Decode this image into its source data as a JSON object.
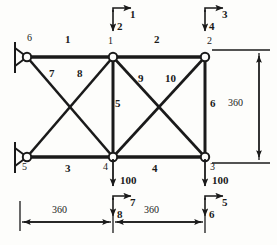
{
  "figure": {
    "type": "truss-diagram",
    "load_value": "100",
    "dimension_value": "360"
  },
  "nodes": [
    {
      "id": "1",
      "label": "1",
      "x": 113,
      "y": 57
    },
    {
      "id": "2",
      "label": "2",
      "x": 205,
      "y": 57
    },
    {
      "id": "3",
      "label": "3",
      "x": 205,
      "y": 157
    },
    {
      "id": "4",
      "label": "4",
      "x": 113,
      "y": 157
    },
    {
      "id": "5",
      "label": "5",
      "x": 27,
      "y": 157
    },
    {
      "id": "6",
      "label": "6",
      "x": 27,
      "y": 57
    }
  ],
  "members": [
    {
      "label": "1",
      "from": "6",
      "to": "1"
    },
    {
      "label": "2",
      "from": "1",
      "to": "2"
    },
    {
      "label": "3",
      "from": "5",
      "to": "4"
    },
    {
      "label": "4",
      "from": "4",
      "to": "3"
    },
    {
      "label": "5",
      "from": "1",
      "to": "4"
    },
    {
      "label": "6",
      "from": "2",
      "to": "3"
    },
    {
      "label": "7",
      "from": "6",
      "to": "4"
    },
    {
      "label": "8",
      "from": "5",
      "to": "1"
    },
    {
      "label": "9",
      "from": "1",
      "to": "3"
    },
    {
      "label": "10",
      "from": "4",
      "to": "2"
    }
  ],
  "member_labels": [
    {
      "text": "1",
      "x": 68,
      "y": 40
    },
    {
      "text": "2",
      "x": 157,
      "y": 40
    },
    {
      "text": "3",
      "x": 68,
      "y": 168
    },
    {
      "text": "4",
      "x": 155,
      "y": 168
    },
    {
      "text": "5",
      "x": 118,
      "y": 103
    },
    {
      "text": "6",
      "x": 212,
      "y": 103
    },
    {
      "text": "7",
      "x": 52,
      "y": 73
    },
    {
      "text": "8",
      "x": 80,
      "y": 73
    },
    {
      "text": "9",
      "x": 140,
      "y": 78
    },
    {
      "text": "10",
      "x": 169,
      "y": 78
    }
  ],
  "node_labels": [
    {
      "text": "6",
      "x": 29,
      "y": 37
    },
    {
      "text": "1",
      "x": 110,
      "y": 40
    },
    {
      "text": "2",
      "x": 208,
      "y": 40
    },
    {
      "text": "5",
      "x": 24,
      "y": 166
    },
    {
      "text": "4",
      "x": 106,
      "y": 166
    },
    {
      "text": "3",
      "x": 212,
      "y": 166
    }
  ],
  "supports": [
    {
      "at_node": "6",
      "kind": "pin-support",
      "x": 27,
      "y": 57
    },
    {
      "at_node": "5",
      "kind": "pin-support",
      "x": 27,
      "y": 157
    }
  ],
  "dof_arrows": [
    {
      "label": "1",
      "at_node": "1",
      "direction": "horizontal-right",
      "label_x": 131,
      "label_y": 12
    },
    {
      "label": "2",
      "at_node": "1",
      "direction": "vertical-down",
      "label_x": 118,
      "label_y": 24
    },
    {
      "label": "3",
      "at_node": "2",
      "direction": "horizontal-right",
      "label_x": 223,
      "label_y": 12
    },
    {
      "label": "4",
      "at_node": "2",
      "direction": "vertical-down",
      "label_x": 210,
      "label_y": 24
    },
    {
      "label": "5",
      "at_node": "3",
      "direction": "horizontal-right",
      "label_x": 223,
      "label_y": 200
    },
    {
      "label": "6",
      "at_node": "3",
      "direction": "vertical-down",
      "label_x": 210,
      "label_y": 212
    },
    {
      "label": "7",
      "at_node": "4",
      "direction": "horizontal-right",
      "label_x": 131,
      "label_y": 200
    },
    {
      "label": "8",
      "at_node": "4",
      "direction": "vertical-down",
      "label_x": 118,
      "label_y": 212
    }
  ],
  "loads": [
    {
      "value": "100",
      "at_node": "4",
      "direction": "down",
      "label_x": 122,
      "label_y": 180
    },
    {
      "value": "100",
      "at_node": "3",
      "direction": "down",
      "label_x": 214,
      "label_y": 180
    }
  ],
  "dimensions": [
    {
      "value": "360",
      "orientation": "vertical",
      "label_x": 236,
      "label_y": 102
    },
    {
      "value": "360",
      "orientation": "horizontal",
      "label_x": 58,
      "label_y": 209
    },
    {
      "value": "360",
      "orientation": "horizontal",
      "label_x": 150,
      "label_y": 209
    }
  ]
}
